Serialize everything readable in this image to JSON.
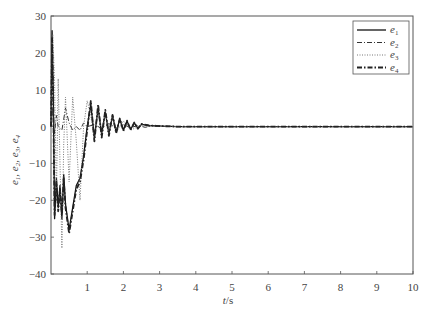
{
  "chart_data": {
    "type": "line",
    "title": "",
    "xlabel": "t/s",
    "ylabel": "e1, e2, e3, e4",
    "xlim": [
      0,
      10
    ],
    "ylim": [
      -40,
      30
    ],
    "xticks": [
      1,
      2,
      3,
      4,
      5,
      6,
      7,
      8,
      9,
      10
    ],
    "yticks": [
      30,
      20,
      10,
      0,
      -10,
      -20,
      -30,
      -40
    ],
    "grid": false,
    "legend_position": "upper right",
    "series": [
      {
        "name": "e1",
        "style": "solid",
        "x": [
          0,
          0.03,
          0.06,
          0.1,
          0.15,
          0.2,
          0.25,
          0.3,
          0.35,
          0.4,
          0.5,
          0.6,
          0.7,
          0.8,
          0.9,
          1.0,
          1.1,
          1.2,
          1.3,
          1.4,
          1.5,
          1.6,
          1.7,
          1.8,
          1.9,
          2.0,
          2.1,
          2.2,
          2.3,
          2.4,
          2.5,
          2.7,
          2.9,
          3.1,
          3.5,
          4,
          5,
          10
        ],
        "y": [
          0,
          26,
          10,
          -25,
          -14,
          -22,
          -16,
          -25,
          -13,
          -21,
          -28,
          -22,
          -16,
          -14,
          -8,
          0,
          6,
          -3,
          5,
          -2,
          4,
          -2,
          3,
          -1.5,
          2,
          -1,
          1.5,
          -0.8,
          1,
          -0.5,
          0.6,
          0.3,
          0.2,
          0.1,
          0,
          0,
          0,
          0
        ]
      },
      {
        "name": "e2",
        "style": "dash-dot",
        "x": [
          0,
          0.05,
          0.1,
          0.15,
          0.2,
          0.3,
          0.4,
          0.5,
          0.6,
          0.7,
          0.8,
          0.9,
          1.0,
          1.2,
          1.4,
          1.6,
          1.8,
          2.0,
          2.2,
          2.4,
          2.6,
          2.8,
          3.0,
          3.5,
          4,
          10
        ],
        "y": [
          0,
          5,
          -2,
          3,
          0,
          -1,
          5,
          1,
          -1,
          0,
          -1,
          1,
          0,
          0.5,
          -0.5,
          0.8,
          -0.4,
          0.5,
          -0.3,
          0.3,
          -0.2,
          0.2,
          0.1,
          0,
          0,
          0
        ]
      },
      {
        "name": "e3",
        "style": "dotted",
        "x": [
          0,
          0.05,
          0.1,
          0.15,
          0.2,
          0.25,
          0.3,
          0.35,
          0.4,
          0.5,
          0.6,
          0.7,
          0.8,
          0.9,
          1.0,
          1.1,
          1.2,
          1.3,
          1.4,
          1.5,
          1.6,
          1.7,
          1.8,
          2.0,
          2.2,
          2.5,
          3.0,
          3.5,
          10
        ],
        "y": [
          0,
          25,
          12,
          -20,
          13,
          -10,
          -33,
          -5,
          8,
          -15,
          8,
          -4,
          -20,
          0,
          7,
          3,
          -4,
          5,
          -3,
          4,
          -2,
          3,
          -1.5,
          1.5,
          -1,
          0.5,
          0.1,
          0,
          0
        ]
      },
      {
        "name": "e4",
        "style": "dash-dot-heavy",
        "x": [
          0,
          0.03,
          0.06,
          0.1,
          0.15,
          0.2,
          0.25,
          0.3,
          0.35,
          0.4,
          0.5,
          0.6,
          0.7,
          0.8,
          0.9,
          1.0,
          1.1,
          1.2,
          1.3,
          1.4,
          1.5,
          1.6,
          1.7,
          1.8,
          1.9,
          2.0,
          2.1,
          2.2,
          2.3,
          2.4,
          2.5,
          2.7,
          2.9,
          3.1,
          3.5,
          4,
          5,
          10
        ],
        "y": [
          0,
          24,
          8,
          -24,
          -15,
          -23,
          -17,
          -24,
          -14,
          -22,
          -29,
          -23,
          -17,
          -15,
          -9,
          -1,
          7,
          -4,
          6,
          -3,
          4.5,
          -2.5,
          3.2,
          -1.8,
          2.2,
          -1.2,
          1.6,
          -0.9,
          1.1,
          -0.6,
          0.7,
          0.3,
          0.2,
          0.1,
          0,
          0,
          0,
          0
        ]
      }
    ]
  },
  "legend": {
    "items": [
      {
        "label": "e",
        "sub": "1"
      },
      {
        "label": "e",
        "sub": "2"
      },
      {
        "label": "e",
        "sub": "3"
      },
      {
        "label": "e",
        "sub": "4"
      }
    ]
  },
  "axes": {
    "xlabel_main": "t",
    "xlabel_unit": "/s",
    "ylabel_text": "e1, e2, e3, e4"
  }
}
